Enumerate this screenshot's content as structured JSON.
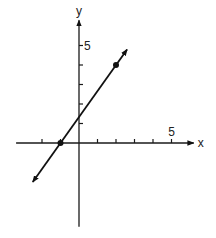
{
  "chart_data": {
    "type": "line",
    "title": "",
    "xlabel": "x",
    "ylabel": "y",
    "xlim": [
      -3.4,
      6.2
    ],
    "ylim": [
      -4.3,
      6.3
    ],
    "x_ticks": [
      -2,
      -1,
      1,
      2,
      3,
      4,
      5
    ],
    "y_ticks": [
      1,
      2,
      3,
      4,
      5
    ],
    "x_tick_labels": [
      {
        "value": 5,
        "label": "5"
      }
    ],
    "y_tick_labels": [
      {
        "value": 5,
        "label": "5"
      }
    ],
    "grid": false,
    "legend": "none",
    "series": [
      {
        "name": "line",
        "equation": "y = (4/3)x + 4/3",
        "slope": 1.3333,
        "intercept": 1.3333,
        "x_range": [
          -2.5,
          2.6
        ],
        "arrows_both_ends": true,
        "points": [
          {
            "x": -1,
            "y": 0
          },
          {
            "x": 2,
            "y": 4
          }
        ]
      }
    ]
  }
}
